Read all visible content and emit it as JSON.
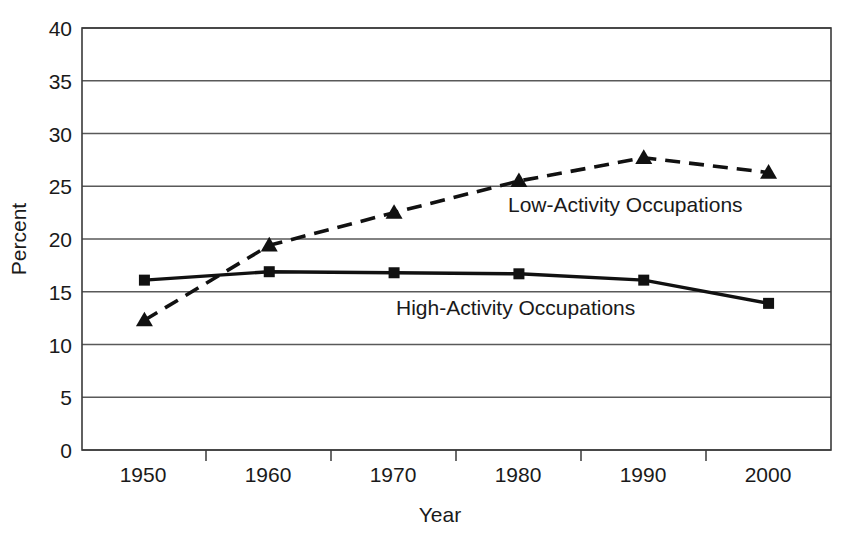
{
  "chart_data": {
    "type": "line",
    "title": "",
    "xlabel": "Year",
    "ylabel": "Percent",
    "x": [
      1950,
      1960,
      1970,
      1980,
      1990,
      2000
    ],
    "categories": [
      "1950",
      "1960",
      "1970",
      "1980",
      "1990",
      "2000"
    ],
    "xlim": [
      1945,
      2005
    ],
    "ylim": [
      0,
      40
    ],
    "ytick_values": [
      0,
      5,
      10,
      15,
      20,
      25,
      30,
      35,
      40
    ],
    "ytick_labels": [
      "0",
      "5",
      "10",
      "15",
      "20",
      "25",
      "30",
      "35",
      "40"
    ],
    "xtick_labels": [
      "1950",
      "1960",
      "1970",
      "1980",
      "1990",
      "2000"
    ],
    "grid": "horizontal",
    "legend_position": "inline-annotations",
    "series": [
      {
        "name": "Low-Activity Occupations",
        "marker": "triangle",
        "linestyle": "dashed",
        "color": "#111111",
        "values": [
          12.3,
          19.4,
          22.5,
          25.5,
          27.7,
          26.3
        ]
      },
      {
        "name": "High-Activity Occupations",
        "marker": "square",
        "linestyle": "solid",
        "color": "#111111",
        "values": [
          16.1,
          16.9,
          16.8,
          16.7,
          16.1,
          13.9
        ]
      }
    ],
    "annotations": [
      {
        "text": "Low-Activity Occupations",
        "x_px": 508,
        "y_px": 212
      },
      {
        "text": "High-Activity Occupations",
        "x_px": 396,
        "y_px": 315
      }
    ]
  },
  "axes": {
    "y_title": "Percent",
    "x_title": "Year"
  }
}
